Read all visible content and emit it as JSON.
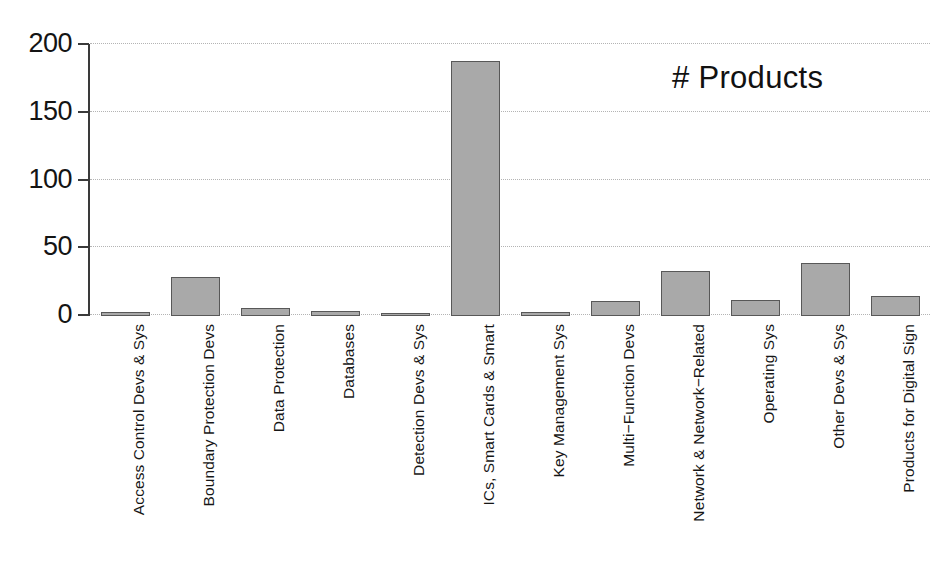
{
  "chart_data": {
    "type": "bar",
    "title": "",
    "subtitle": "",
    "annotation": "# Products",
    "xlabel": "",
    "ylabel": "",
    "ylim": [
      0,
      200
    ],
    "yticks": [
      0,
      50,
      100,
      150,
      200
    ],
    "ytick_labels": [
      "0",
      "50",
      "100",
      "150",
      "200"
    ],
    "grid": true,
    "grid_axis": "y",
    "legend_position": "top-right-inside",
    "bar_fill_color": "#a9a9a9",
    "bar_edge_color": "#585858",
    "axis_color": "#3a3a3a",
    "gridline_color": "#b4b4b4",
    "background_color": "#ffffff",
    "categories": [
      "Access Control Devs & Sys",
      "Boundary Protection Devs",
      "Data Protection",
      "Databases",
      "Detection Devs & Sys",
      "ICs, Smart Cards & Smart",
      "Key Management Sys",
      "Multi−Function Devs",
      "Network & Network−Related",
      "Operating Sys",
      "Other Devs & Sys",
      "Products for Digital Sign"
    ],
    "values": [
      3,
      29,
      6,
      4,
      1,
      188,
      3,
      11,
      33,
      12,
      39,
      15
    ],
    "series": [
      {
        "name": "# Products",
        "values": [
          3,
          29,
          6,
          4,
          1,
          188,
          3,
          11,
          33,
          12,
          39,
          15
        ]
      }
    ]
  }
}
